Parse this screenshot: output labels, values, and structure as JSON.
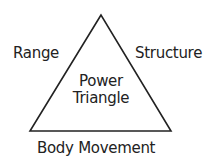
{
  "diagram": {
    "shape": "triangle",
    "stroke_color": "#222222",
    "center_label": {
      "line1": "Power",
      "line2": "Triangle"
    },
    "sides": {
      "left": "Range",
      "right": "Structure",
      "bottom": "Body Movement"
    }
  }
}
